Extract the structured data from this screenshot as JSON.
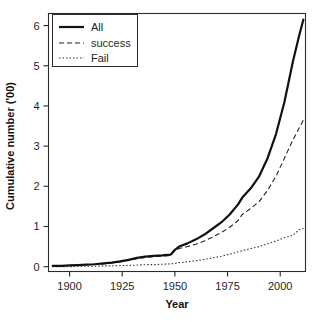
{
  "chart_data": {
    "type": "line",
    "title": "",
    "xlabel": "Year",
    "ylabel": "Cumulative number ('00)",
    "xlim": [
      1890,
      2012
    ],
    "ylim": [
      -0.12,
      6.3
    ],
    "grid": false,
    "legend_position": "top-left",
    "xticks": [
      1900,
      1925,
      1950,
      1975,
      2000
    ],
    "xtick_labels": [
      "1900",
      "1925",
      "1950",
      "1975",
      "2000"
    ],
    "yticks": [
      0,
      1,
      2,
      3,
      4,
      5,
      6
    ],
    "ytick_labels": [
      "0",
      "1",
      "2",
      "3",
      "4",
      "5",
      "6"
    ],
    "x": [
      1892,
      1896,
      1900,
      1904,
      1908,
      1912,
      1916,
      1920,
      1924,
      1928,
      1932,
      1936,
      1940,
      1944,
      1948,
      1950,
      1952,
      1956,
      1960,
      1964,
      1968,
      1972,
      1976,
      1980,
      1982,
      1986,
      1990,
      1994,
      1998,
      2002,
      2006,
      2009,
      2011
    ],
    "series": [
      {
        "name": "All",
        "style": "solid",
        "values": [
          0.02,
          0.02,
          0.03,
          0.04,
          0.05,
          0.06,
          0.08,
          0.1,
          0.13,
          0.17,
          0.22,
          0.25,
          0.27,
          0.28,
          0.3,
          0.42,
          0.5,
          0.58,
          0.68,
          0.8,
          0.95,
          1.1,
          1.3,
          1.55,
          1.72,
          1.95,
          2.25,
          2.7,
          3.3,
          4.1,
          5.1,
          5.75,
          6.15
        ]
      },
      {
        "name": "success",
        "style": "dashed",
        "values": [
          0.02,
          0.02,
          0.03,
          0.04,
          0.05,
          0.06,
          0.07,
          0.09,
          0.12,
          0.16,
          0.2,
          0.23,
          0.25,
          0.26,
          0.28,
          0.4,
          0.45,
          0.5,
          0.56,
          0.64,
          0.74,
          0.85,
          0.98,
          1.15,
          1.3,
          1.45,
          1.62,
          1.9,
          2.25,
          2.7,
          3.15,
          3.45,
          3.65
        ]
      },
      {
        "name": "Fail",
        "style": "dotted",
        "values": [
          0.0,
          0.0,
          0.0,
          0.01,
          0.01,
          0.01,
          0.02,
          0.02,
          0.03,
          0.03,
          0.04,
          0.05,
          0.05,
          0.06,
          0.07,
          0.08,
          0.1,
          0.12,
          0.15,
          0.18,
          0.22,
          0.26,
          0.31,
          0.37,
          0.4,
          0.45,
          0.5,
          0.57,
          0.64,
          0.72,
          0.78,
          0.92,
          0.95
        ]
      }
    ],
    "legend_entries": [
      {
        "label": "All",
        "style": "solid"
      },
      {
        "label": "success",
        "style": "dashed"
      },
      {
        "label": "Fail",
        "style": "dotted"
      }
    ]
  }
}
